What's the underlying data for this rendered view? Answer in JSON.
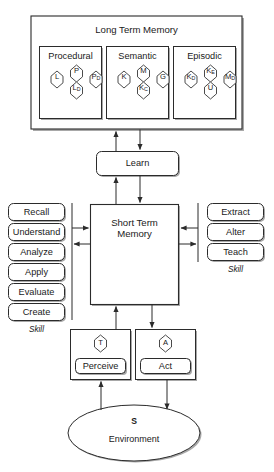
{
  "diagram": {
    "title": "Long Term Memory",
    "stroke_color": "#2b2b2b",
    "shadow_color": "#9a9a9a",
    "background": "#ffffff"
  },
  "long_term_memory": {
    "label": "Long Term Memory",
    "compartments": [
      {
        "name": "procedural",
        "label": "Procedural",
        "nodes": [
          {
            "id": "L",
            "base": "L",
            "sub": "",
            "pos": "left"
          },
          {
            "id": "P",
            "base": "P",
            "sub": "",
            "pos": "top"
          },
          {
            "id": "PD",
            "base": "P",
            "sub": "D",
            "pos": "right"
          },
          {
            "id": "LD",
            "base": "L",
            "sub": "D",
            "pos": "bottom"
          }
        ]
      },
      {
        "name": "semantic",
        "label": "Semantic",
        "nodes": [
          {
            "id": "K",
            "base": "K",
            "sub": "",
            "pos": "left"
          },
          {
            "id": "M",
            "base": "M",
            "sub": "",
            "pos": "top"
          },
          {
            "id": "G",
            "base": "G",
            "sub": "",
            "pos": "right"
          },
          {
            "id": "KC",
            "base": "K",
            "sub": "C",
            "pos": "bottom"
          }
        ]
      },
      {
        "name": "episodic",
        "label": "Episodic",
        "nodes": [
          {
            "id": "KD",
            "base": "K",
            "sub": "D",
            "pos": "left"
          },
          {
            "id": "KE",
            "base": "K",
            "sub": "E",
            "pos": "top"
          },
          {
            "id": "MD",
            "base": "M",
            "sub": "D",
            "pos": "right"
          },
          {
            "id": "U",
            "base": "U",
            "sub": "",
            "pos": "bottom"
          }
        ]
      }
    ]
  },
  "learn": {
    "label": "Learn"
  },
  "short_term_memory": {
    "label": "Short Term\nMemory"
  },
  "left_skills": {
    "group_label": "Skill",
    "items": [
      {
        "label": "Recall"
      },
      {
        "label": "Understand"
      },
      {
        "label": "Analyze"
      },
      {
        "label": "Apply"
      },
      {
        "label": "Evaluate"
      },
      {
        "label": "Create"
      }
    ]
  },
  "right_skills": {
    "group_label": "Skill",
    "items": [
      {
        "label": "Extract"
      },
      {
        "label": "Alter"
      },
      {
        "label": "Teach"
      }
    ]
  },
  "perceive": {
    "hex_label": "T",
    "label": "Perceive"
  },
  "act": {
    "hex_label": "A",
    "label": "Act"
  },
  "environment": {
    "symbol": "S",
    "label": "Environment"
  }
}
